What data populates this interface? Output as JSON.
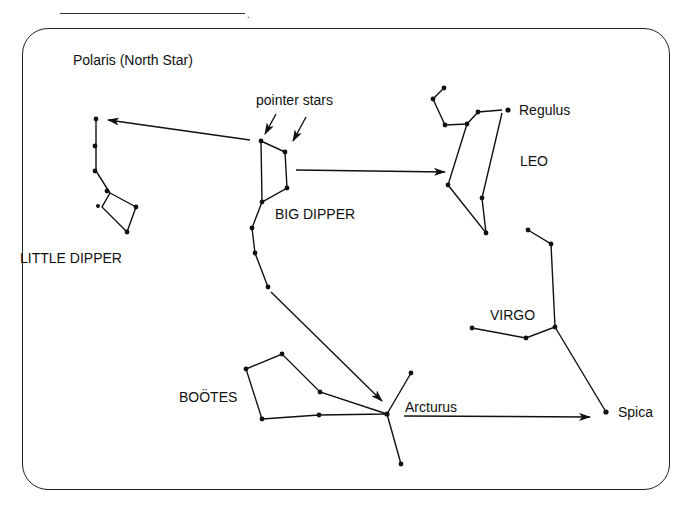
{
  "header": {
    "answer_blank": "",
    "blank_suffix": "."
  },
  "labels": {
    "polaris": "Polaris (North Star)",
    "pointer_stars": "pointer stars",
    "big_dipper": "BIG DIPPER",
    "little_dipper": "LITTLE DIPPER",
    "leo": "LEO",
    "regulus": "Regulus",
    "virgo": "VIRGO",
    "bootes": "BOÖTES",
    "arcturus": "Arcturus",
    "spica": "Spica"
  },
  "colors": {
    "ink": "#111111",
    "background": "#ffffff"
  }
}
